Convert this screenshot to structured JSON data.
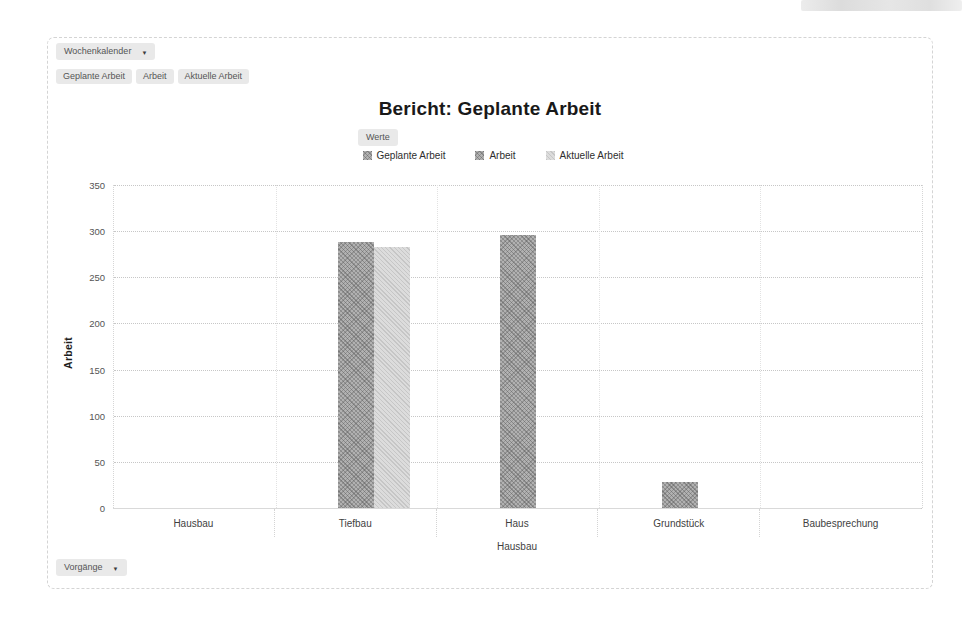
{
  "toolbar": {
    "top_dropdown": {
      "label": "Wochenkalender"
    },
    "field_chips": [
      "Geplante Arbeit",
      "Arbeit",
      "Aktuelle Arbeit"
    ],
    "values_chip": "Werte",
    "bottom_dropdown": {
      "label": "Vorgänge"
    }
  },
  "chart_data": {
    "type": "bar",
    "title": "Bericht: Geplante Arbeit",
    "xlabel": "Hausbau",
    "ylabel": "Arbeit",
    "ylim": [
      0,
      350
    ],
    "ytick_step": 50,
    "grid": "dotted-horizontal",
    "legend_position": "top",
    "categories": [
      "Hausbau",
      "Tiefbau",
      "Haus",
      "Grundstück",
      "Baubesprechung"
    ],
    "series": [
      {
        "name": "Geplante Arbeit",
        "color": "#b1b1b1",
        "style": "hatch-dark",
        "values": [
          0,
          0,
          0,
          0,
          0
        ]
      },
      {
        "name": "Arbeit",
        "color": "#b1b1b1",
        "style": "hatch-dark",
        "values": [
          0,
          288,
          296,
          28,
          0
        ]
      },
      {
        "name": "Aktuelle Arbeit",
        "color": "#dcdcdc",
        "style": "hatch-light",
        "values": [
          0,
          283,
          0,
          0,
          0
        ]
      }
    ]
  }
}
